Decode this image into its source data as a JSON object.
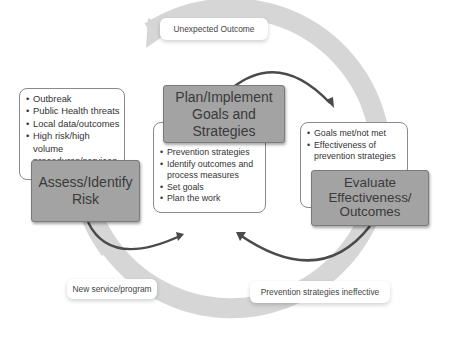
{
  "diagram": {
    "title_boxes": {
      "assess": "Assess/Identify\nRisk",
      "plan": "Plan/Implement\nGoals and Strategies",
      "evaluate": "Evaluate\nEffectiveness/\nOutcomes"
    },
    "bullet_boxes": {
      "assess": [
        "Outbreak",
        "Public Health threats",
        "Local data/outcomes",
        "High risk/high volume procedures/services"
      ],
      "plan": [
        "Prevention strategies",
        "Identify outcomes and process measures",
        "Set goals",
        "Plan the work"
      ],
      "evaluate": [
        "Goals met/not met",
        "Effectiveness of prevention strategies"
      ]
    },
    "labels": {
      "unexpected": "Unexpected Outcome",
      "new_service": "New service/program",
      "ineffective": "Prevention strategies ineffective"
    },
    "colors": {
      "ring": "#d6d6d6",
      "title_box_fill": "#a3a3a3",
      "arrow": "#4a4a4a"
    }
  }
}
